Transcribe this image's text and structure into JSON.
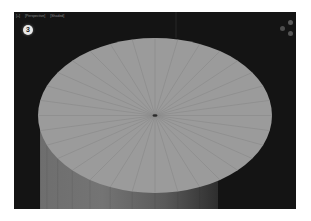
{
  "viewport": {
    "header": {
      "labels": [
        "[+]",
        "[Perspective]",
        "[Shaded]"
      ]
    },
    "step_badge": "3",
    "gizmos": [
      "view-cube-icon",
      "orbit-icon",
      "zoom-icon"
    ],
    "scene": {
      "object": "cylinder",
      "top_face_segments": 32,
      "colors": {
        "background": "#141414",
        "top_face": "#9b9b9b",
        "edge_lines": "#858585",
        "side_light": "#7a7a7a",
        "side_dark": "#3a3a3a",
        "center_vertex": "#2a2a2a"
      }
    }
  }
}
